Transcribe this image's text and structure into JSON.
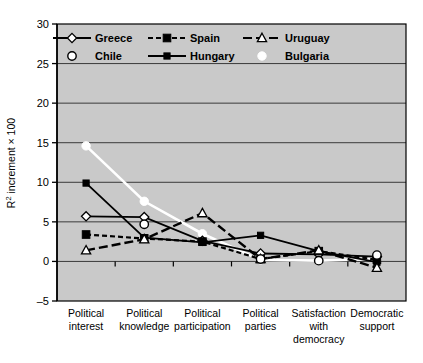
{
  "chart_data": {
    "type": "line",
    "title": "",
    "xlabel": "",
    "ylabel": "R² increment × 100",
    "ylabel_base": "R",
    "ylabel_sup": "2",
    "ylabel_rest": " increment × 100",
    "ylim": [
      -5,
      30
    ],
    "yticks": [
      -5,
      0,
      5,
      10,
      15,
      20,
      25,
      30
    ],
    "ytick_labels": [
      "–5",
      "0",
      "5",
      "10",
      "15",
      "20",
      "25",
      "30"
    ],
    "grid": true,
    "legend_position": "top-inside",
    "plot_background": "#c9c9c9",
    "categories": [
      "Political\ninterest",
      "Political\nknowledge",
      "Political\nparticipation",
      "Political\nparties",
      "Satisfaction\nwith\ndemocracy",
      "Democratic\nsupport"
    ],
    "category_lines": [
      [
        "Political",
        "interest"
      ],
      [
        "Political",
        "knowledge"
      ],
      [
        "Political",
        "participation"
      ],
      [
        "Political",
        "parties"
      ],
      [
        "Satisfaction",
        "with",
        "democracy"
      ],
      [
        "Democratic",
        "support"
      ]
    ],
    "series": [
      {
        "name": "Greece",
        "color": "#000000",
        "marker": "diamond-open",
        "line": "solid",
        "values": [
          5.7,
          5.6,
          2.6,
          1.0,
          0.9,
          0.6
        ]
      },
      {
        "name": "Spain",
        "color": "#000000",
        "marker": "square-filled",
        "line": "dashed",
        "values": [
          3.4,
          2.9,
          2.5,
          0.3,
          1.3,
          0.2
        ]
      },
      {
        "name": "Uruguay",
        "color": "#000000",
        "marker": "triangle-open",
        "line": "long-dash",
        "values": [
          1.4,
          2.8,
          6.1,
          0.3,
          1.4,
          -0.8
        ]
      },
      {
        "name": "Chile",
        "color": "#000000",
        "marker": "circle-open",
        "line": "none",
        "values": [
          null,
          4.7,
          null,
          0.3,
          0.1,
          0.8
        ]
      },
      {
        "name": "Hungary",
        "color": "#000000",
        "marker": "square-small-filled",
        "line": "solid",
        "values": [
          9.9,
          3.0,
          2.4,
          3.3,
          1.3,
          -0.1
        ]
      },
      {
        "name": "Bulgaria",
        "color": "#ffffff",
        "marker": "circle-filled-white",
        "line": "solid-white",
        "values": [
          14.6,
          7.6,
          3.5,
          0.2,
          0.1,
          0.3
        ]
      }
    ]
  },
  "legend": {
    "row1": [
      {
        "label": "Greece",
        "key": "greece"
      },
      {
        "label": "Spain",
        "key": "spain"
      },
      {
        "label": "Uruguay",
        "key": "uruguay"
      }
    ],
    "row2": [
      {
        "label": "Chile",
        "key": "chile"
      },
      {
        "label": "Hungary",
        "key": "hungary"
      },
      {
        "label": "Bulgaria",
        "key": "bulgaria"
      }
    ]
  },
  "axis": {
    "y_label_full": "R2 increment × 100"
  }
}
